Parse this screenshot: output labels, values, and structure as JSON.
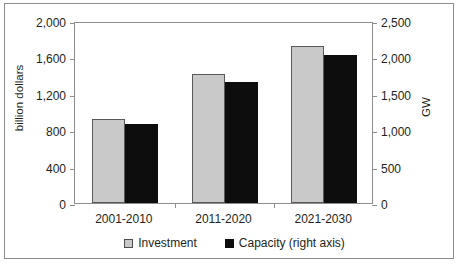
{
  "chart_data": {
    "type": "bar",
    "title": "",
    "subtitle": "",
    "categories": [
      "2001-2010",
      "2011-2020",
      "2021-2030"
    ],
    "series": [
      {
        "name": "Investment",
        "axis": "left",
        "unit": "billion dollars",
        "color": "#c9c9c9",
        "values": [
          925,
          1420,
          1720
        ]
      },
      {
        "name": "Capacity (right axis)",
        "axis": "right",
        "unit": "GW",
        "color": "#0d0d0d",
        "values": [
          1090,
          1660,
          2030
        ]
      }
    ],
    "xlabel": "",
    "ylabel_left": "billion dollars",
    "ylabel_right": "GW",
    "ylim_left": [
      0,
      2000
    ],
    "ylim_right": [
      0,
      2500
    ],
    "yticks_left": [
      "0",
      "400",
      "800",
      "1,200",
      "1,600",
      "2,000"
    ],
    "ytick_values_left": [
      0,
      400,
      800,
      1200,
      1600,
      2000
    ],
    "yticks_right": [
      "0",
      "500",
      "1,000",
      "1,500",
      "2,000",
      "2,500"
    ],
    "ytick_values_right": [
      0,
      500,
      1000,
      1500,
      2000,
      2500
    ],
    "grid": false,
    "legend_position": "bottom-center",
    "legend": [
      {
        "label": "Investment",
        "swatch": "investment"
      },
      {
        "label": "Capacity (right axis)",
        "swatch": "capacity"
      }
    ],
    "colors": {
      "investment_fill": "#c9c9c9",
      "investment_edge": "#595959",
      "capacity_fill": "#0d0d0d",
      "axis": "#8d8d8d",
      "text": "#231f20",
      "background": "#ffffff"
    }
  }
}
